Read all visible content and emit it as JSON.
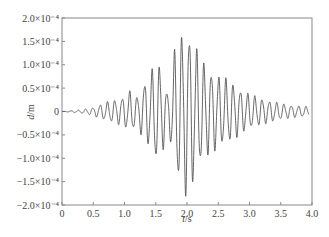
{
  "chart_data": {
    "type": "line",
    "title": "",
    "xlabel": "t/s",
    "xlabel_var": "t",
    "xlabel_unit": "/s",
    "ylabel": "d/m",
    "ylabel_var": "d",
    "ylabel_unit": "/m",
    "xlim": [
      0,
      4.0
    ],
    "ylim": [
      -0.0002,
      0.0002
    ],
    "grid": false,
    "legend": null,
    "x_ticks": [
      0,
      0.5,
      1.0,
      1.5,
      2.0,
      2.5,
      3.0,
      3.5,
      4.0
    ],
    "x_tick_labels": [
      "0",
      "0.5",
      "1.0",
      "1.5",
      "2.0",
      "2.5",
      "3.0",
      "3.5",
      "4.0"
    ],
    "y_ticks": [
      0.0002,
      0.00015,
      0.0001,
      5e-05,
      0,
      -5e-05,
      -0.0001,
      -0.00015,
      -0.0002
    ],
    "y_tick_labels": [
      "2.0×10⁻⁴",
      "1.5×10⁻⁴",
      "1.0×10⁻⁴",
      "0.5×10⁻⁴",
      "0",
      "−0.5×10⁻⁴",
      "−1.0×10⁻⁴",
      "−1.5×10⁻⁴",
      "−2.0×10⁻⁴"
    ],
    "series": [
      {
        "name": "displacement",
        "color": "#555555",
        "description": "Oscillating displacement time history, amplitude growing from ~0 at t=0, peaking near t=2.0 s, decaying toward t=4.0 s",
        "dominant_frequency_hz": 8.5,
        "envelope": {
          "t": [
            0.0,
            0.3,
            0.5,
            0.7,
            0.9,
            1.0,
            1.1,
            1.2,
            1.3,
            1.4,
            1.5,
            1.6,
            1.7,
            1.8,
            1.9,
            2.0,
            2.1,
            2.2,
            2.3,
            2.5,
            2.7,
            2.9,
            3.1,
            3.3,
            3.5,
            3.7,
            3.9
          ],
          "amp": [
            0.0,
            3e-06,
            8e-06,
            1.8e-05,
            2.5e-05,
            3e-05,
            4.2e-05,
            2.8e-05,
            5.5e-05,
            7e-05,
            0.0001,
            8.5e-05,
            3e-05,
            0.00012,
            0.00015,
            0.000168,
            0.00014,
            0.00011,
            9e-05,
            7.2e-05,
            6e-05,
            4e-05,
            3e-05,
            2.2e-05,
            1.6e-05,
            1.2e-05,
            1e-05
          ]
        },
        "peaks": {
          "max": {
            "t": 2.0,
            "value": 0.000166
          },
          "min": {
            "t": 2.02,
            "value": -0.000174
          }
        }
      }
    ]
  },
  "plot": {
    "frame": {
      "left": 62,
      "top": 18,
      "right": 312,
      "bottom": 205
    }
  }
}
